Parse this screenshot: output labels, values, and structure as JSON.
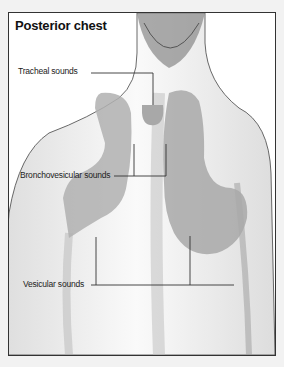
{
  "figure": {
    "title": "Posterior chest",
    "labels": {
      "tracheal": "Tracheal sounds",
      "bronchovesicular": "Bronchovesicular sounds",
      "vesicular": "Vesicular sounds"
    },
    "colors": {
      "region_fill": "#b0b0b0",
      "frame": "#333333",
      "leader_line": "#333333"
    }
  }
}
